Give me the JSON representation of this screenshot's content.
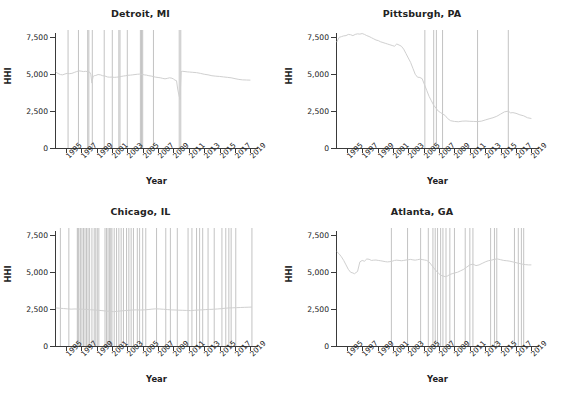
{
  "figure": {
    "axis_title_x": "Year",
    "axis_title_y": "HHI",
    "grid": "2x2",
    "line_color": "#d0d0d0",
    "event_line_color": "#bcbcbc",
    "axis_color": "#3a3a3a",
    "background": "#ffffff"
  },
  "chart_data": [
    {
      "type": "line",
      "title": "Detroit, MI",
      "xlabel": "Year",
      "ylabel": "HHI",
      "xlim": [
        1993.6,
        2019.6
      ],
      "ylim": [
        0,
        8000
      ],
      "yticks": [
        0,
        2500,
        5000,
        7500
      ],
      "ytick_labels": [
        "0",
        "2,500",
        "5,000",
        "7,500"
      ],
      "xticks": [
        1995,
        1997,
        1999,
        2001,
        2003,
        2005,
        2007,
        2009,
        2011,
        2013,
        2015,
        2017,
        2019
      ],
      "xtick_labels": [
        "1995",
        "1997",
        "1999",
        "2001",
        "2003",
        "2005",
        "2007",
        "2009",
        "2011",
        "2013",
        "2015",
        "2017",
        "2019"
      ],
      "grid": false,
      "legend": "none",
      "series": [
        {
          "name": "HHI",
          "x": [
            1993.7,
            1994.0,
            1994.3,
            1994.6,
            1994.9,
            1995.2,
            1995.5,
            1995.8,
            1996.1,
            1996.4,
            1996.7,
            1997.0,
            1997.3,
            1997.6,
            1997.9,
            1998.1,
            1998.25,
            1998.4,
            1998.55,
            1998.7,
            1998.9,
            1999.2,
            1999.5,
            1999.8,
            2000.1,
            2000.4,
            2000.7,
            2001.0,
            2001.3,
            2001.6,
            2001.9,
            2002.2,
            2002.5,
            2002.8,
            2003.1,
            2003.4,
            2003.7,
            2004.0,
            2004.3,
            2004.6,
            2004.9,
            2005.2,
            2005.5,
            2005.8,
            2006.1,
            2006.4,
            2006.7,
            2007.0,
            2007.3,
            2007.6,
            2007.9,
            2008.2,
            2008.5,
            2008.8,
            2009.0,
            2009.2,
            2009.4,
            2009.55,
            2009.7,
            2009.85,
            2010.0,
            2010.2,
            2010.5,
            2010.8,
            2011.1,
            2011.5,
            2012.0,
            2012.5,
            2013.0,
            2013.5,
            2014.0,
            2014.5,
            2015.0,
            2015.5,
            2016.0,
            2016.5,
            2017.0,
            2017.5,
            2018.0,
            2018.5,
            2019.0
          ],
          "y": [
            5150,
            5050,
            4980,
            4960,
            5020,
            5060,
            5040,
            5060,
            5120,
            5180,
            5230,
            5210,
            5180,
            5200,
            5170,
            5150,
            5000,
            4400,
            4850,
            4900,
            4920,
            4980,
            4960,
            4900,
            4880,
            4820,
            4800,
            4810,
            4790,
            4800,
            4820,
            4850,
            4880,
            4900,
            4930,
            4940,
            4960,
            4980,
            5000,
            5010,
            4990,
            4960,
            4940,
            4900,
            4880,
            4840,
            4800,
            4780,
            4760,
            4720,
            4690,
            4720,
            4760,
            4730,
            4680,
            4600,
            4560,
            4000,
            3600,
            3300,
            5180,
            5200,
            5180,
            5160,
            5150,
            5130,
            5110,
            5060,
            5000,
            4960,
            4900,
            4870,
            4850,
            4820,
            4790,
            4760,
            4700,
            4650,
            4620,
            4610,
            4600
          ]
        }
      ],
      "event_lines": [
        1995.3,
        1996.65,
        1997.85,
        1998.0,
        1998.45,
        2000.0,
        2001.05,
        2001.9,
        2002.05,
        2003.0,
        2004.7,
        2004.85,
        2005.0,
        2006.4,
        2009.75,
        2009.95
      ]
    },
    {
      "type": "line",
      "title": "Pittsburgh, PA",
      "xlabel": "Year",
      "ylabel": "HHI",
      "xlim": [
        1993.6,
        2019.6
      ],
      "ylim": [
        0,
        8000
      ],
      "yticks": [
        0,
        2500,
        5000,
        7500
      ],
      "ytick_labels": [
        "0",
        "2,500",
        "5,000",
        "7,500"
      ],
      "xticks": [
        1995,
        1997,
        1999,
        2001,
        2003,
        2005,
        2007,
        2009,
        2011,
        2013,
        2015,
        2017,
        2019
      ],
      "xtick_labels": [
        "1995",
        "1997",
        "1999",
        "2001",
        "2003",
        "2005",
        "2007",
        "2009",
        "2011",
        "2013",
        "2015",
        "2017",
        "2019"
      ],
      "grid": false,
      "legend": "none",
      "series": [
        {
          "name": "HHI",
          "x": [
            1993.7,
            1994.0,
            1994.3,
            1994.6,
            1994.9,
            1995.2,
            1995.5,
            1995.8,
            1996.1,
            1996.4,
            1996.7,
            1997.0,
            1997.3,
            1997.6,
            1997.9,
            1998.2,
            1998.5,
            1998.8,
            1999.1,
            1999.4,
            1999.7,
            2000.0,
            2000.3,
            2000.6,
            2000.9,
            2001.2,
            2001.5,
            2001.8,
            2002.1,
            2002.4,
            2002.7,
            2003.0,
            2003.3,
            2003.6,
            2003.9,
            2004.2,
            2004.5,
            2004.8,
            2005.1,
            2005.4,
            2005.7,
            2006.0,
            2006.3,
            2006.6,
            2006.9,
            2007.2,
            2007.5,
            2007.8,
            2008.1,
            2008.5,
            2009.0,
            2009.5,
            2010.0,
            2010.5,
            2011.0,
            2011.5,
            2012.0,
            2012.5,
            2013.0,
            2013.5,
            2014.0,
            2014.5,
            2015.0,
            2015.5,
            2016.0,
            2016.3,
            2016.6,
            2017.0,
            2017.5,
            2018.0,
            2018.5,
            2019.0
          ],
          "y": [
            7180,
            7500,
            7550,
            7600,
            7620,
            7700,
            7680,
            7620,
            7700,
            7740,
            7720,
            7760,
            7700,
            7620,
            7560,
            7480,
            7400,
            7320,
            7280,
            7200,
            7150,
            7100,
            7050,
            7000,
            6950,
            6900,
            7050,
            6980,
            6900,
            6700,
            6400,
            6100,
            5800,
            5400,
            5000,
            4800,
            4780,
            4700,
            4300,
            3900,
            3500,
            3200,
            2900,
            2700,
            2500,
            2400,
            2300,
            2200,
            2000,
            1850,
            1800,
            1780,
            1820,
            1830,
            1810,
            1800,
            1790,
            1820,
            1900,
            1980,
            2050,
            2150,
            2300,
            2450,
            2500,
            2380,
            2400,
            2350,
            2250,
            2180,
            2050,
            2000
          ]
        }
      ],
      "event_lines": [
        2005.15,
        2006.3,
        2006.65,
        2007.45,
        2012.0,
        2016.0
      ]
    },
    {
      "type": "line",
      "title": "Chicago, IL",
      "xlabel": "Year",
      "ylabel": "HHI",
      "xlim": [
        1993.6,
        2019.6
      ],
      "ylim": [
        0,
        8000
      ],
      "yticks": [
        0,
        2500,
        5000,
        7500
      ],
      "ytick_labels": [
        "0",
        "2,500",
        "5,000",
        "7,500"
      ],
      "xticks": [
        1995,
        1997,
        1999,
        2001,
        2003,
        2005,
        2007,
        2009,
        2011,
        2013,
        2015,
        2017,
        2019
      ],
      "xtick_labels": [
        "1995",
        "1997",
        "1999",
        "2001",
        "2003",
        "2005",
        "2007",
        "2009",
        "2011",
        "2013",
        "2015",
        "2017",
        "2019"
      ],
      "grid": false,
      "legend": "none",
      "series": [
        {
          "name": "HHI",
          "x": [
            1993.7,
            1994.2,
            1994.7,
            1995.2,
            1995.7,
            1996.2,
            1996.7,
            1997.2,
            1997.7,
            1998.2,
            1998.7,
            1999.2,
            1999.7,
            2000.2,
            2000.7,
            2001.2,
            2001.7,
            2002.2,
            2002.7,
            2003.2,
            2003.7,
            2004.2,
            2004.7,
            2005.2,
            2005.7,
            2006.2,
            2006.7,
            2007.2,
            2007.7,
            2008.2,
            2008.7,
            2009.2,
            2009.7,
            2010.2,
            2010.7,
            2011.2,
            2011.7,
            2012.2,
            2012.7,
            2013.2,
            2013.7,
            2014.2,
            2014.7,
            2015.2,
            2015.7,
            2016.2,
            2016.7,
            2017.2,
            2017.7,
            2018.2,
            2018.7,
            2019.2
          ],
          "y": [
            2580,
            2560,
            2540,
            2520,
            2500,
            2510,
            2500,
            2490,
            2480,
            2460,
            2440,
            2420,
            2400,
            2370,
            2350,
            2330,
            2350,
            2380,
            2400,
            2420,
            2440,
            2450,
            2440,
            2450,
            2470,
            2500,
            2520,
            2510,
            2490,
            2470,
            2450,
            2440,
            2430,
            2420,
            2410,
            2400,
            2420,
            2440,
            2450,
            2470,
            2480,
            2490,
            2510,
            2530,
            2560,
            2580,
            2590,
            2600,
            2610,
            2620,
            2630,
            2640
          ]
        }
      ],
      "event_lines": [
        1994.3,
        1995.4,
        1996.5,
        1996.6,
        1996.7,
        1996.9,
        1997.1,
        1997.3,
        1997.5,
        1997.7,
        1997.9,
        1998.1,
        1998.4,
        1998.7,
        1998.9,
        1999.1,
        1999.3,
        2000.1,
        2000.3,
        2000.5,
        2000.7,
        2000.85,
        2001.0,
        2001.3,
        2001.6,
        2001.9,
        2002.2,
        2002.5,
        2002.9,
        2003.2,
        2003.5,
        2003.8,
        2004.3,
        2004.6,
        2005.0,
        2005.4,
        2006.8,
        2008.0,
        2008.6,
        2009.5,
        2010.9,
        2011.4,
        2012.0,
        2012.4,
        2012.8,
        2013.5,
        2014.3,
        2015.3,
        2015.8,
        2016.2,
        2016.5,
        2017.1,
        2019.2
      ]
    },
    {
      "type": "line",
      "title": "Atlanta, GA",
      "xlabel": "Year",
      "ylabel": "HHI",
      "xlim": [
        1993.6,
        2019.6
      ],
      "ylim": [
        0,
        8000
      ],
      "yticks": [
        0,
        2500,
        5000,
        7500
      ],
      "ytick_labels": [
        "0",
        "2,500",
        "5,000",
        "7,500"
      ],
      "xticks": [
        1995,
        1997,
        1999,
        2001,
        2003,
        2005,
        2007,
        2009,
        2011,
        2013,
        2015,
        2017,
        2019
      ],
      "xtick_labels": [
        "1995",
        "1997",
        "1999",
        "2001",
        "2003",
        "2005",
        "2007",
        "2009",
        "2011",
        "2013",
        "2015",
        "2017",
        "2019"
      ],
      "grid": false,
      "legend": "none",
      "series": [
        {
          "name": "HHI",
          "x": [
            1993.7,
            1994.0,
            1994.3,
            1994.6,
            1994.9,
            1995.2,
            1995.5,
            1995.8,
            1996.0,
            1996.2,
            1996.4,
            1996.7,
            1997.0,
            1997.3,
            1997.6,
            1997.9,
            1998.2,
            1998.5,
            1998.8,
            1999.1,
            1999.4,
            1999.7,
            2000.0,
            2000.3,
            2000.6,
            2000.9,
            2001.2,
            2001.5,
            2001.8,
            2002.1,
            2002.4,
            2002.7,
            2003.0,
            2003.3,
            2003.6,
            2003.9,
            2004.2,
            2004.5,
            2004.8,
            2005.1,
            2005.4,
            2005.7,
            2006.0,
            2006.3,
            2006.6,
            2006.9,
            2007.2,
            2007.5,
            2007.8,
            2008.1,
            2008.4,
            2008.7,
            2009.0,
            2009.4,
            2009.8,
            2010.2,
            2010.6,
            2011.0,
            2011.4,
            2011.8,
            2012.2,
            2012.6,
            2013.0,
            2013.4,
            2013.8,
            2014.2,
            2014.6,
            2015.0,
            2015.4,
            2015.8,
            2016.2,
            2016.6,
            2017.0,
            2017.4,
            2017.8,
            2018.2,
            2018.6,
            2019.0
          ],
          "y": [
            6400,
            6250,
            6050,
            5800,
            5500,
            5200,
            5000,
            4950,
            4900,
            4980,
            5050,
            5700,
            5800,
            5750,
            5900,
            5880,
            5800,
            5820,
            5830,
            5800,
            5780,
            5750,
            5720,
            5700,
            5720,
            5750,
            5800,
            5820,
            5800,
            5780,
            5800,
            5830,
            5850,
            5870,
            5840,
            5820,
            5850,
            5880,
            5860,
            5830,
            5800,
            5700,
            5500,
            5300,
            5100,
            4950,
            4800,
            4750,
            4700,
            4750,
            4850,
            4900,
            4950,
            5000,
            5100,
            5200,
            5350,
            5500,
            5550,
            5450,
            5500,
            5600,
            5700,
            5780,
            5820,
            5880,
            5900,
            5850,
            5800,
            5780,
            5750,
            5700,
            5650,
            5600,
            5550,
            5520,
            5500,
            5500
          ]
        }
      ],
      "event_lines": [
        2000.8,
        2002.9,
        2004.6,
        2005.6,
        2006.2,
        2006.5,
        2006.8,
        2007.2,
        2007.5,
        2007.9,
        2008.4,
        2009.0,
        2010.4,
        2011.0,
        2011.4,
        2013.7,
        2014.2,
        2014.5,
        2016.8,
        2017.3,
        2017.7,
        2018.0
      ]
    }
  ]
}
